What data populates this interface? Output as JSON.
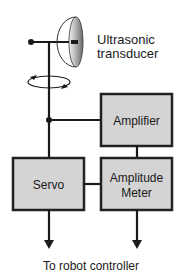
{
  "diagram": {
    "transducer_label_line1": "Ultrasonic",
    "transducer_label_line2": "transducer",
    "blocks": {
      "amplifier": "Amplifier",
      "servo": "Servo",
      "amplitude_meter_line1": "Amplitude",
      "amplitude_meter_line2": "Meter"
    },
    "output_label": "To robot controller",
    "colors": {
      "line": "#1a1a1a",
      "block_fill": "#d4d4d4",
      "block_border": "#222222"
    }
  }
}
